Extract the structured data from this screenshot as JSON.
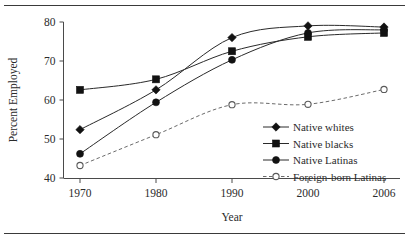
{
  "chart_data": {
    "type": "line",
    "title": "",
    "xlabel": "Year",
    "ylabel": "Percent Employed",
    "categories": [
      "1970",
      "1980",
      "1990",
      "2000",
      "2006"
    ],
    "x_tick_labels": [
      "1970",
      "1980",
      "1990",
      "2000",
      "2006"
    ],
    "y_tick_labels": [
      "40",
      "50",
      "60",
      "70",
      "80"
    ],
    "y_ticks": [
      40,
      50,
      60,
      70,
      80
    ],
    "ylim": [
      40,
      80
    ],
    "grid": false,
    "legend_position": "lower right inside plot",
    "series": [
      {
        "name": "Native whites",
        "marker": "filled-diamond",
        "line_style": "solid",
        "values": [
          52.4,
          62.6,
          76.0,
          79.0,
          78.7
        ]
      },
      {
        "name": "Native blacks",
        "marker": "filled-square",
        "line_style": "solid",
        "values": [
          62.6,
          65.3,
          72.5,
          76.2,
          77.2
        ]
      },
      {
        "name": "Native Latinas",
        "marker": "filled-circle",
        "line_style": "solid",
        "values": [
          46.2,
          59.4,
          70.3,
          77.2,
          78.0
        ]
      },
      {
        "name": "Foreign-born Latinas",
        "marker": "open-circle",
        "line_style": "dashed",
        "values": [
          43.2,
          51.1,
          58.8,
          58.9,
          62.7
        ]
      }
    ]
  },
  "legend": {
    "items": [
      {
        "label": "Native whites"
      },
      {
        "label": "Native blacks"
      },
      {
        "label": "Native Latinas"
      },
      {
        "label": "Foreign-born Latinas"
      }
    ]
  },
  "colors": {
    "line": "#2a2a2a",
    "dashed_line": "#6b6b6b",
    "marker_fill": "#121212",
    "marker_open_fill": "#ffffff",
    "axis": "#4a4a4a",
    "text": "#2b2b2b",
    "rule": "#3a3a3a",
    "background": "#ffffff"
  }
}
